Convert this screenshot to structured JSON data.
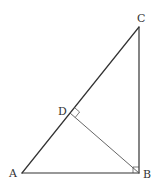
{
  "diagram": {
    "type": "geometry",
    "points": {
      "A": {
        "label": "A",
        "x": 22,
        "y": 173
      },
      "B": {
        "label": "B",
        "x": 139,
        "y": 173
      },
      "C": {
        "label": "C",
        "x": 139,
        "y": 27
      },
      "D": {
        "label": "D",
        "x": 70,
        "y": 113
      }
    },
    "segments": [
      "AB",
      "BC",
      "CA",
      "BD"
    ],
    "right_angles": [
      "ABC",
      "BDC"
    ],
    "colors": {
      "line": "#333333",
      "background": "#ffffff"
    }
  }
}
